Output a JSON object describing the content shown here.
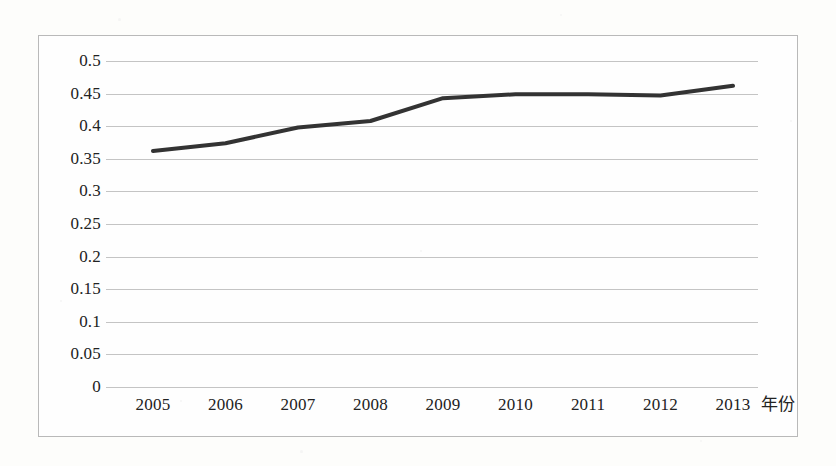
{
  "chart_data": {
    "type": "line",
    "title": "",
    "xlabel": "年份",
    "ylabel": "",
    "categories": [
      "2005",
      "2006",
      "2007",
      "2008",
      "2009",
      "2010",
      "2011",
      "2012",
      "2013"
    ],
    "series": [
      {
        "name": "",
        "values": [
          0.362,
          0.374,
          0.398,
          0.408,
          0.443,
          0.449,
          0.449,
          0.447,
          0.462
        ]
      }
    ],
    "ylim": [
      0,
      0.5
    ],
    "yticks": [
      "0",
      "0.05",
      "0.1",
      "0.15",
      "0.2",
      "0.25",
      "0.3",
      "0.35",
      "0.4",
      "0.45",
      "0.5"
    ],
    "ytick_values": [
      0,
      0.05,
      0.1,
      0.15,
      0.2,
      0.25,
      0.3,
      0.35,
      0.4,
      0.45,
      0.5
    ],
    "grid": true,
    "grid_axis": "y",
    "legend": false,
    "legend_position": "none",
    "markers": false,
    "line_color": "#333333",
    "gridline_color": "#c4c4c4",
    "border_color": "#b9b9b9",
    "background_color": "#fefefe"
  }
}
